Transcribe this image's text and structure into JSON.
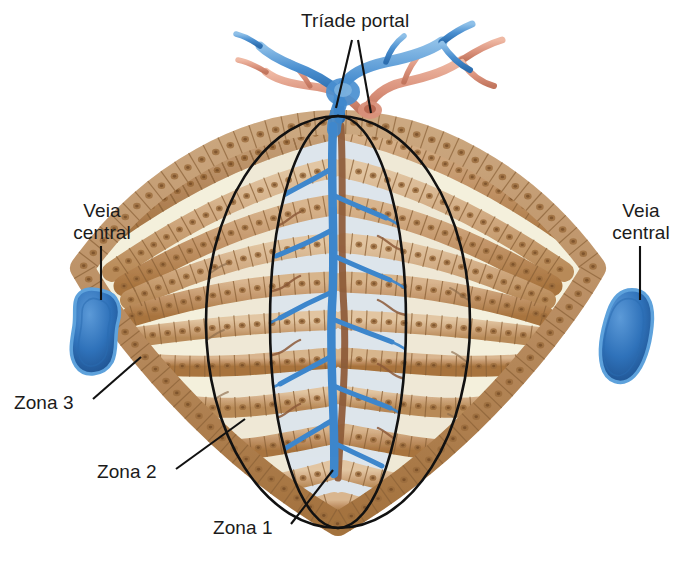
{
  "figure": {
    "language": "pt-BR",
    "background_color": "#ffffff"
  },
  "labels": {
    "portal_triad": "Tríade portal",
    "central_vein_left": "Veia\ncentral",
    "central_vein_right": "Veia\ncentral",
    "zone_3": "Zona 3",
    "zone_2": "Zona 2",
    "zone_1": "Zona 1"
  },
  "colors": {
    "hepatocyte_fill": "#c2946a",
    "hepatocyte_fill_light": "#d7b28c",
    "hepatocyte_outline": "#8a6137",
    "nucleus": "#9a6c3c",
    "sinusoid_space": "#f4f0dc",
    "zone1_tint": "#dde5ec",
    "zone2_tint": "#efe9d6",
    "central_vein_blue": "#2e6fb7",
    "central_vein_blue_dark": "#1f558f",
    "portal_vein_blue": "#4a8fd0",
    "hepatic_artery_salmon": "#d99279",
    "bile_duct_brown": "#8d5b3a",
    "zone_outline": "#111111",
    "leader_line": "#111111",
    "text": "#1b1b1b"
  },
  "structures": {
    "portal_triad": {
      "position": "top-center",
      "components": [
        "portal vein (blue)",
        "hepatic artery (salmon)",
        "bile duct (brown)"
      ]
    },
    "central_veins": [
      {
        "side": "left",
        "shape": "rounded peanut",
        "color": "#2e6fb7"
      },
      {
        "side": "right",
        "shape": "rounded oval",
        "color": "#2e6fb7"
      }
    ],
    "zones": [
      {
        "name": "Zona 1",
        "description": "periportal, innermost ellipse"
      },
      {
        "name": "Zona 2",
        "description": "intermediate ellipse"
      },
      {
        "name": "Zona 3",
        "description": "pericentral, outermost region"
      }
    ],
    "hepatocyte_cords": {
      "count_per_side": 7,
      "orientation": "radiating horizontally from portal triad toward central veins"
    }
  },
  "leader_lines": {
    "portal_triad": [
      {
        "from": [
          352,
          40
        ],
        "to": [
          336,
          108
        ]
      },
      {
        "from": [
          358,
          40
        ],
        "to": [
          371,
          113
        ]
      }
    ],
    "central_vein_left": {
      "from": [
        101,
        246
      ],
      "to": [
        101,
        300
      ]
    },
    "central_vein_right": {
      "from": [
        640,
        246
      ],
      "to": [
        640,
        300
      ]
    },
    "zone_3": {
      "from": [
        93,
        399
      ],
      "to": [
        141,
        357
      ]
    },
    "zone_2": {
      "from": [
        176,
        469
      ],
      "to": [
        245,
        419
      ]
    },
    "zone_1": {
      "from": [
        291,
        524
      ],
      "to": [
        333,
        470
      ]
    }
  }
}
